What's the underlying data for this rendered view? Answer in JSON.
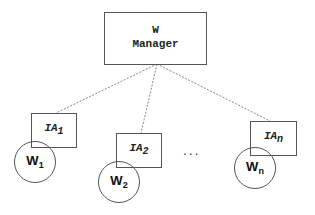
{
  "diagram": {
    "manager": {
      "line1": "W",
      "line2": "Manager"
    },
    "agents": [
      {
        "label": "IA",
        "sub": "1"
      },
      {
        "label": "IA",
        "sub": "2"
      },
      {
        "label": "IA",
        "sub": "n"
      }
    ],
    "workers": [
      {
        "label": "W",
        "sub": "1"
      },
      {
        "label": "W",
        "sub": "2"
      },
      {
        "label": "W",
        "sub": "n"
      }
    ],
    "ellipsis": "...",
    "colors": {
      "stroke": "#555555",
      "text": "#222222",
      "background": "#ffffff"
    }
  }
}
